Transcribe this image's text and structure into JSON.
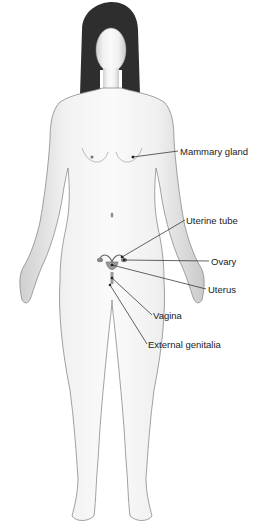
{
  "figure": {
    "labels": [
      {
        "id": "mammary",
        "text": "Mammary gland",
        "x": 180,
        "y": 147
      },
      {
        "id": "uterine-tube",
        "text": "Uterine tube",
        "x": 186,
        "y": 216
      },
      {
        "id": "ovary",
        "text": "Ovary",
        "x": 211,
        "y": 257
      },
      {
        "id": "uterus",
        "text": "Uterus",
        "x": 208,
        "y": 285
      },
      {
        "id": "vagina",
        "text": "Vagina",
        "x": 153,
        "y": 311
      },
      {
        "id": "external-genitalia",
        "text": "External genitalia",
        "x": 148,
        "y": 340
      }
    ]
  }
}
